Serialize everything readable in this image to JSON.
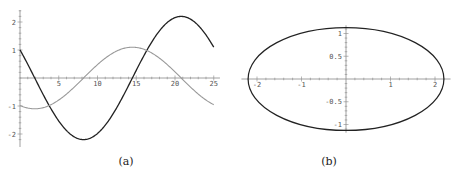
{
  "chart_data": [
    {
      "type": "line",
      "title": "",
      "caption": "(a)",
      "xlabel": "",
      "ylabel": "",
      "xlim": [
        0,
        25
      ],
      "ylim": [
        -2.3,
        2.5
      ],
      "grid": false,
      "x_ticks": [
        "5",
        "10",
        "15",
        "20",
        "25"
      ],
      "y_ticks": [
        "2",
        "1",
        "-1",
        "-2"
      ],
      "series": [
        {
          "name": "dark curve",
          "color": "#222222",
          "x": [
            0,
            2,
            4,
            6,
            8.2,
            10,
            12,
            14.7,
            17,
            19,
            20.8,
            23,
            25
          ],
          "values": [
            1.0,
            0.0,
            -1.2,
            -1.9,
            -2.2,
            -2.0,
            -1.3,
            0.0,
            1.4,
            2.0,
            2.2,
            1.9,
            1.0
          ]
        },
        {
          "name": "gray curve",
          "color": "#999999",
          "x": [
            0,
            2.5,
            5,
            8,
            10,
            12,
            14.5,
            17,
            20.5,
            23,
            25
          ],
          "values": [
            -1.0,
            -1.1,
            -0.9,
            0.0,
            0.5,
            0.9,
            1.1,
            0.9,
            0.0,
            -0.6,
            -1.0
          ]
        }
      ]
    },
    {
      "type": "line",
      "title": "",
      "caption": "(b)",
      "xlabel": "",
      "ylabel": "",
      "xlim": [
        -2.3,
        2.3
      ],
      "ylim": [
        -1.15,
        1.15
      ],
      "grid": false,
      "x_ticks": [
        "-2",
        "-1",
        "1",
        "2"
      ],
      "y_ticks": [
        "1",
        "0.5",
        "-0.5",
        "-1"
      ],
      "series": [
        {
          "name": "ellipse",
          "color": "#222222",
          "shape": "ellipse",
          "center": [
            0,
            0
          ],
          "semi_major_x": 2.2,
          "semi_minor_y": 1.13
        }
      ]
    }
  ]
}
